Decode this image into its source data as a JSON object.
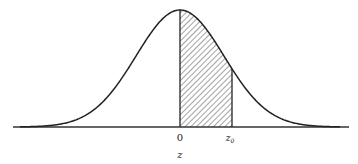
{
  "diagram": {
    "type": "normal-distribution-curve",
    "shaded_region": {
      "from_label": "0",
      "to_label": "z₀",
      "pattern": "diagonal-hatch"
    },
    "labels": {
      "origin": "0",
      "z0_main": "z",
      "z0_sub": "0",
      "axis_variable": "z"
    },
    "colors": {
      "stroke": "#222222",
      "background": "#ffffff"
    }
  }
}
